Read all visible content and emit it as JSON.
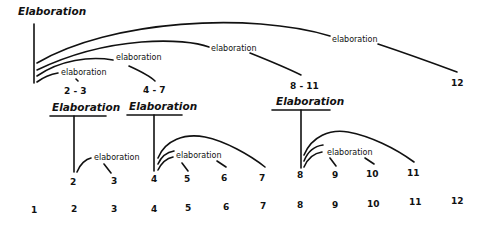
{
  "diagram": {
    "type": "rhetorical-structure-tree",
    "top": {
      "relation": "Elaboration",
      "nucleus": "1",
      "satellites": [
        {
          "relation": "elaboration",
          "span": "2 - 3"
        },
        {
          "relation": "elaboration",
          "span": "4 - 7"
        },
        {
          "relation": "elaboration",
          "span": "8 - 11"
        },
        {
          "relation": "elaboration",
          "span": "12"
        }
      ]
    },
    "subtrees": [
      {
        "relation": "Elaboration",
        "nucleus": "2",
        "satellite_label": "elaboration",
        "satellites": [
          "3"
        ]
      },
      {
        "relation": "Elaboration",
        "nucleus": "4",
        "satellite_label": "elaboration",
        "satellites": [
          "5",
          "6",
          "7"
        ]
      },
      {
        "relation": "Elaboration",
        "nucleus": "8",
        "satellite_label": "elaboration",
        "satellites": [
          "9",
          "10",
          "11"
        ]
      }
    ],
    "units": [
      "1",
      "2",
      "3",
      "4",
      "5",
      "6",
      "7",
      "8",
      "9",
      "10",
      "11",
      "12"
    ]
  }
}
